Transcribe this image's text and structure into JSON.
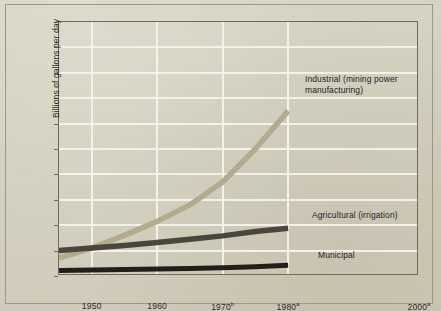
{
  "figure": {
    "frame": true,
    "background_hex": "#d7d3c3",
    "grid_hex": "#f4f2ea",
    "axis_hex": "#6f6a5c"
  },
  "chart_data": {
    "type": "line",
    "title": "",
    "subtitle": "",
    "xlabel": "",
    "ylabel": "Billions of gallons per day",
    "xlim": [
      1945,
      2000
    ],
    "ylim": [
      0,
      1000
    ],
    "grid": true,
    "legend_position": "inline-annotations",
    "y_ticks": [
      0,
      100,
      200,
      300,
      400,
      500,
      600,
      700,
      800,
      900,
      1000
    ],
    "y_tick_labels": [
      "0",
      "100",
      "200",
      "300",
      "400",
      "500",
      "600",
      "700",
      "800",
      "900",
      "1000"
    ],
    "x_ticks": [
      1950,
      1960,
      1970,
      1980,
      2000
    ],
    "x_tick_labels": [
      "1950",
      "1960",
      "1970",
      "1980",
      "2000"
    ],
    "x_tick_superscripts": [
      "",
      "",
      "b",
      "a",
      "a"
    ],
    "series": [
      {
        "name": "Industrial (mining power manufacturing)",
        "label": "Industrial (mining power\nmanufacturing)",
        "color_hex": "#b3ab8e",
        "x": [
          1945,
          1950,
          1955,
          1960,
          1965,
          1970,
          1975,
          1980
        ],
        "values": [
          70,
          110,
          160,
          215,
          280,
          370,
          500,
          650
        ]
      },
      {
        "name": "Agricultural (irrigation)",
        "label": "Agricultural (irrigation)",
        "color_hex": "#4a463e",
        "x": [
          1945,
          1950,
          1955,
          1960,
          1965,
          1970,
          1975,
          1980
        ],
        "values": [
          100,
          110,
          120,
          132,
          145,
          158,
          175,
          188
        ]
      },
      {
        "name": "Municipal",
        "label": "Municipal",
        "color_hex": "#221f1b",
        "x": [
          1945,
          1950,
          1955,
          1960,
          1965,
          1970,
          1975,
          1980
        ],
        "values": [
          22,
          24,
          26,
          28,
          30,
          32,
          36,
          42
        ]
      }
    ],
    "annotations": [
      {
        "text": "Industrial (mining power\nmanufacturing)",
        "x_px": 304,
        "y_px": 73
      },
      {
        "text": "Agricultural (irrigation)",
        "x_px": 311,
        "y_px": 209
      },
      {
        "text": "Municipal",
        "x_px": 317,
        "y_px": 249
      }
    ]
  }
}
